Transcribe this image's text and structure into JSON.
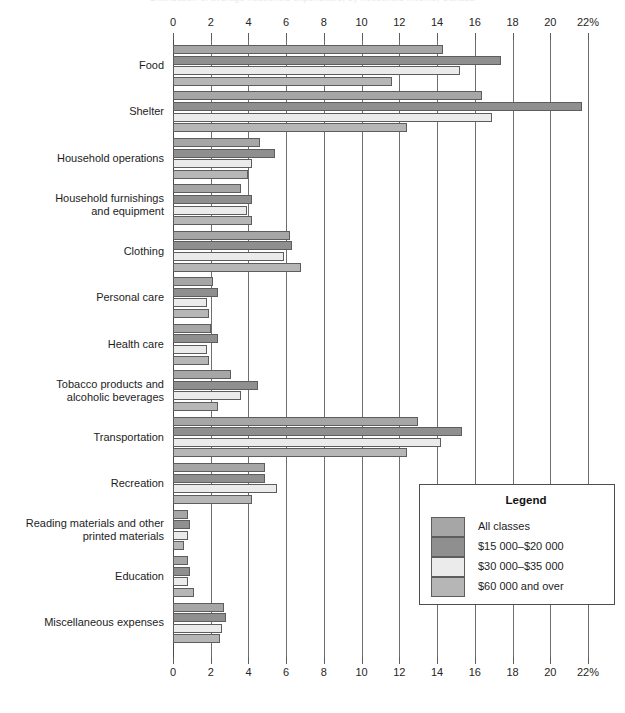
{
  "clipped_title": "Distribution of average household expenditure, by household income, Canada",
  "legend": {
    "title": "Legend",
    "entries": [
      {
        "label": "All classes",
        "color": "#a6a6a6"
      },
      {
        "label": "$15 000–$20 000",
        "color": "#8f8f8f"
      },
      {
        "label": "$30 000–$35 000",
        "color": "#ebebeb"
      },
      {
        "label": "$60 000 and over",
        "color": "#b6b6b6"
      }
    ]
  },
  "axis": {
    "ticks": [
      "0",
      "2",
      "4",
      "6",
      "8",
      "10",
      "12",
      "14",
      "16",
      "18",
      "20",
      "22%"
    ],
    "tick_values": [
      0,
      2,
      4,
      6,
      8,
      10,
      12,
      14,
      16,
      18,
      20,
      22
    ],
    "min": 0,
    "max": 22,
    "unit": "%"
  },
  "chart_data": {
    "type": "bar",
    "orientation": "horizontal",
    "title": "",
    "xlabel": "",
    "ylabel": "",
    "xlim": [
      0,
      22
    ],
    "grid": true,
    "legend_position": "bottom-right",
    "categories": [
      "Food",
      "Shelter",
      "Household operations",
      "Household furnishings and equipment",
      "Clothing",
      "Personal care",
      "Health care",
      "Tobacco products and alcoholic beverages",
      "Transportation",
      "Recreation",
      "Reading materials and other printed materials",
      "Education",
      "Miscellaneous expenses"
    ],
    "category_lines": [
      [
        "Food"
      ],
      [
        "Shelter"
      ],
      [
        "Household operations"
      ],
      [
        "Household furnishings",
        "and equipment"
      ],
      [
        "Clothing"
      ],
      [
        "Personal care"
      ],
      [
        "Health care"
      ],
      [
        "Tobacco products and",
        "alcoholic beverages"
      ],
      [
        "Transportation"
      ],
      [
        "Recreation"
      ],
      [
        "Reading materials and other",
        "printed materials"
      ],
      [
        "Education"
      ],
      [
        "Miscellaneous expenses"
      ]
    ],
    "series": [
      {
        "name": "All classes",
        "color": "#a6a6a6",
        "values": [
          14.3,
          16.4,
          4.6,
          3.6,
          6.2,
          2.1,
          2.0,
          3.1,
          13.0,
          4.9,
          0.8,
          0.8,
          2.7
        ]
      },
      {
        "name": "$15 000–$20 000",
        "color": "#8f8f8f",
        "values": [
          17.4,
          21.7,
          5.4,
          4.2,
          6.3,
          2.4,
          2.4,
          4.5,
          15.3,
          4.9,
          0.9,
          0.9,
          2.8
        ]
      },
      {
        "name": "$30 000–$35 000",
        "color": "#ebebeb",
        "values": [
          15.2,
          16.9,
          4.2,
          3.9,
          5.9,
          1.8,
          1.8,
          3.6,
          14.2,
          5.5,
          0.8,
          0.8,
          2.6
        ]
      },
      {
        "name": "$60 000 and over",
        "color": "#b6b6b6",
        "values": [
          11.6,
          12.4,
          4.0,
          4.2,
          6.8,
          1.9,
          1.9,
          2.4,
          12.4,
          4.2,
          0.6,
          1.1,
          2.5
        ]
      }
    ]
  }
}
